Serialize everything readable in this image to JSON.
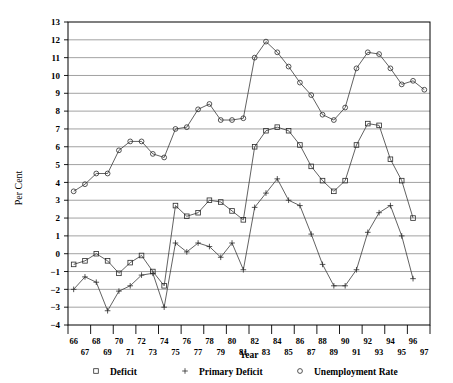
{
  "chart_data": {
    "type": "line",
    "title": "",
    "xlabel": "Year",
    "ylabel": "Per Cent",
    "ylim": [
      -4,
      13
    ],
    "ytick_step": 1,
    "grid": true,
    "legend_position": "bottom",
    "x": [
      66,
      67,
      68,
      69,
      70,
      71,
      72,
      73,
      74,
      75,
      76,
      77,
      78,
      79,
      80,
      81,
      82,
      83,
      84,
      85,
      86,
      87,
      88,
      89,
      90,
      91,
      92,
      93,
      94,
      95,
      96,
      97
    ],
    "xtick_labels_top": [
      "66",
      "68",
      "70",
      "72",
      "74",
      "76",
      "78",
      "80",
      "82",
      "84",
      "86",
      "88",
      "90",
      "92",
      "94",
      "96"
    ],
    "xtick_labels_bottom": [
      "67",
      "69",
      "71",
      "73",
      "75",
      "77",
      "79",
      "81",
      "83",
      "85",
      "87",
      "89",
      "91",
      "93",
      "95",
      "97"
    ],
    "ytick_labels": [
      "13",
      "12",
      "11",
      "10",
      "9",
      "8",
      "7",
      "6",
      "5",
      "4",
      "3",
      "2",
      "1",
      "0",
      "-1",
      "-2",
      "-3",
      "-4"
    ],
    "series": [
      {
        "name": "Deficit",
        "marker": "square",
        "values": [
          -0.6,
          -0.4,
          0.0,
          -0.4,
          -1.1,
          -0.5,
          -0.1,
          -1.0,
          -1.8,
          2.7,
          2.1,
          2.3,
          3.0,
          2.9,
          2.4,
          1.9,
          6.0,
          6.9,
          7.1,
          6.9,
          6.1,
          4.9,
          4.1,
          3.5,
          4.1,
          6.1,
          7.3,
          7.2,
          5.3,
          4.1,
          2.0,
          null
        ]
      },
      {
        "name": "Primary Deficit",
        "marker": "plus",
        "values": [
          -2.0,
          -1.3,
          -1.6,
          -3.2,
          -2.1,
          -1.8,
          -1.2,
          -1.1,
          -3.0,
          0.6,
          0.1,
          0.6,
          0.4,
          -0.2,
          0.6,
          -0.9,
          2.6,
          3.4,
          4.2,
          3.0,
          2.7,
          1.1,
          -0.6,
          -1.8,
          -1.8,
          -0.9,
          1.2,
          2.3,
          2.7,
          1.0,
          -1.4,
          null
        ]
      },
      {
        "name": "Unemployment Rate",
        "marker": "circle",
        "values": [
          3.5,
          3.9,
          4.5,
          4.5,
          5.8,
          6.3,
          6.3,
          5.6,
          5.4,
          7.0,
          7.1,
          8.1,
          8.4,
          7.5,
          7.5,
          7.6,
          11.0,
          11.9,
          11.3,
          10.5,
          9.6,
          8.9,
          7.8,
          7.5,
          8.2,
          10.4,
          11.3,
          11.2,
          10.4,
          9.5,
          9.7,
          9.2
        ]
      }
    ]
  },
  "legend": {
    "items": [
      {
        "label": "Deficit",
        "marker": "square"
      },
      {
        "label": "Primary Deficit",
        "marker": "plus"
      },
      {
        "label": "Unemployment Rate",
        "marker": "circle"
      }
    ]
  }
}
